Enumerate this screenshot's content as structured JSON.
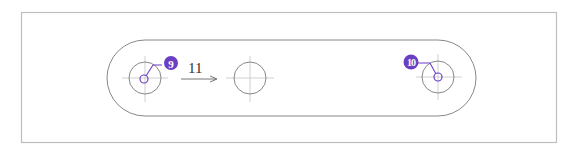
{
  "drawing": {
    "frame_color": "#b8b8b8",
    "line_color": "#7a7a7a",
    "center_line_color": "#bdbdbd",
    "accent_color": "#6a3fc4",
    "callouts": [
      {
        "id": "9",
        "label": "9"
      },
      {
        "id": "10",
        "label": "10"
      }
    ],
    "arrow_label": "11"
  }
}
